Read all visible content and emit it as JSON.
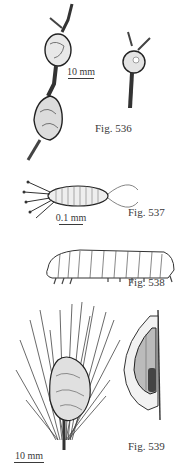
{
  "plate": {
    "figures": [
      {
        "id": "536",
        "label": "Fig. 536",
        "subject": "twig galls on branch",
        "scale_text": "10 mm"
      },
      {
        "id": "537",
        "label": "Fig. 537",
        "subject": "mite / larva with setae (magnified)",
        "scale_text": "0.1 mm"
      },
      {
        "id": "538",
        "label": "Fig. 538",
        "subject": "caterpillar larva, lateral view"
      },
      {
        "id": "539",
        "label": "Fig. 539",
        "subject": "resin gall on pine shoot with needles; gall cross-section with pupa",
        "scale_text": "10 mm"
      }
    ]
  },
  "colors": {
    "ink": "#2a2a2a",
    "background": "#ffffff"
  }
}
